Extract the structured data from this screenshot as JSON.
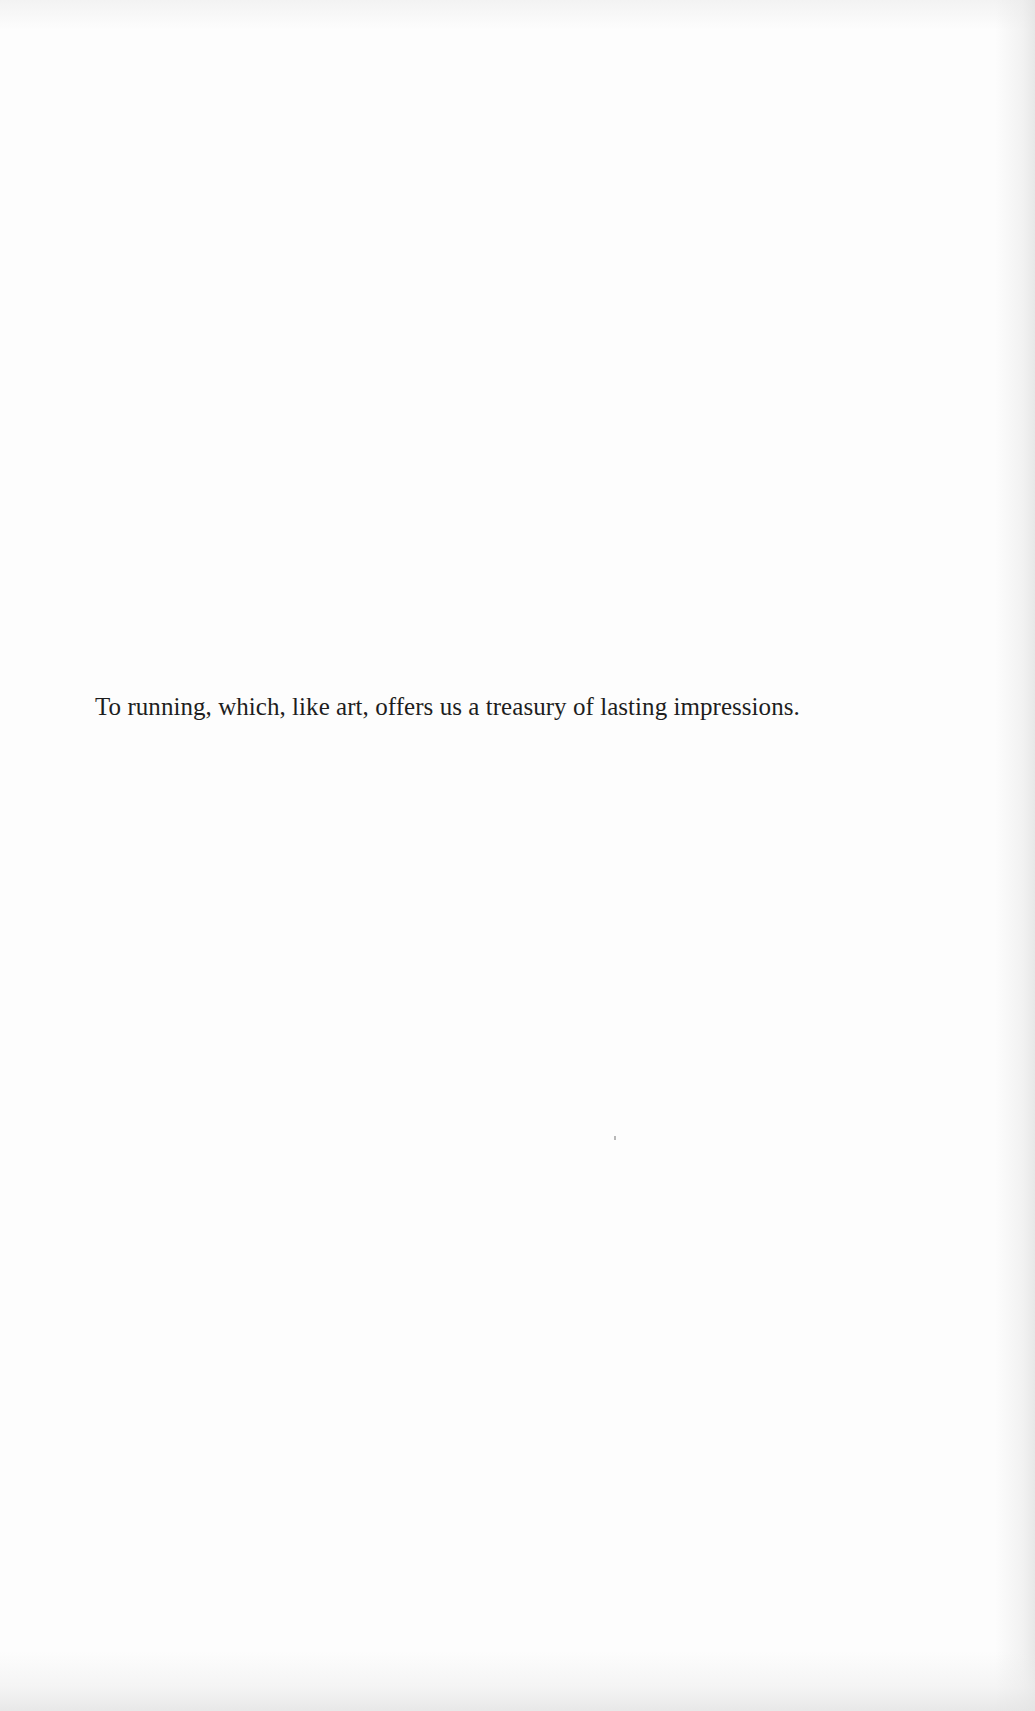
{
  "page": {
    "type": "dedication",
    "background_color": "#fdfdfd",
    "text_color": "#1e1e1e"
  },
  "dedication": {
    "text": "To running, which, like art, offers us a treasury of lasting impressions."
  }
}
